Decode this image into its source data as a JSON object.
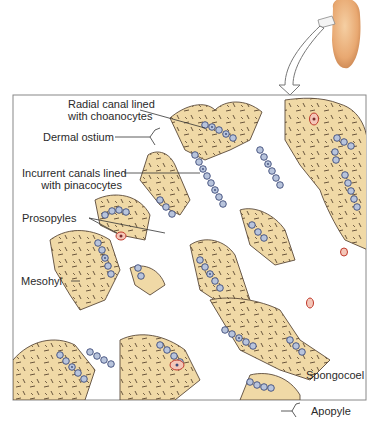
{
  "figure": {
    "colors": {
      "mesohyl": "#f0d9a6",
      "mesohyl_edge": "#5a4a3a",
      "spicule": "#5a4630",
      "choanocyte": "#b8c4dc",
      "choanocyte_edge": "#3c4a78",
      "flagellum": "#3c4a78",
      "amoebocyte_fill": "#f4c6b8",
      "amoebocyte_edge": "#c0392b",
      "sponge_body": "#e8a871",
      "frame": "#777777"
    }
  },
  "labels": {
    "radial_canal_line1": "Radial canal lined",
    "radial_canal_line2": "with choanocytes",
    "dermal_ostium": "Dermal ostium",
    "incurrent_line1": "Incurrent canals lined",
    "incurrent_line2": "with pinacocytes",
    "prosopyles": "Prosopyles",
    "mesohyl": "Mesohyl",
    "spongocoel": "Spongocoel",
    "apopyle": "Apopyle"
  }
}
